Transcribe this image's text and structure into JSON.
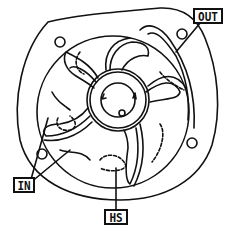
{
  "diagram": {
    "labels": {
      "out": "OUT",
      "in": "IN",
      "hs": "HS"
    },
    "colors": {
      "line": "#111111",
      "background": "#ffffff"
    }
  }
}
